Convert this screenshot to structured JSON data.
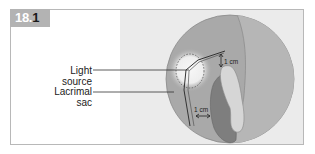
{
  "figure": {
    "badge_main": "18.",
    "badge_last": "1",
    "labels": {
      "light_source": "Light source",
      "lacrimal_sac_line1": "Lacrimal",
      "lacrimal_sac_line2": "sac"
    },
    "annotations": {
      "vertical_distance": "1 cm",
      "horizontal_distance": "1 cm"
    },
    "colors": {
      "badge_bg": "#b3b3b3",
      "panel_bg": "#ebebeb",
      "circle_fill": "#a9a9a9",
      "circle_right": "#b9b9b9",
      "sac_dark": "#7e7e7e",
      "sac_light": "#d6d6d6",
      "glow": "#f2f2f2"
    }
  }
}
